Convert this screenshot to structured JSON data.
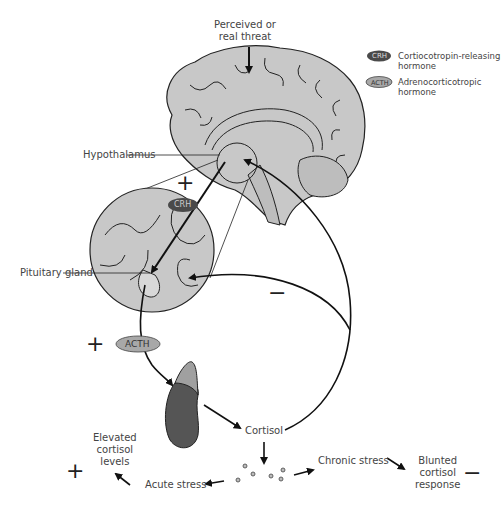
{
  "trigger": {
    "line1": "Perceived or",
    "line2": "real threat"
  },
  "legend": {
    "crh": {
      "abbr": "CRH",
      "label1": "Cortiocotropin-releasing",
      "label2": "hormone",
      "color": "#4a4a4a"
    },
    "acth": {
      "abbr": "ACTH",
      "label1": "Adrenocorticotropic",
      "label2": "hormone",
      "color": "#a8a8a8"
    }
  },
  "structures": {
    "hypothalamus": "Hypothalamus",
    "pituitary": "Pituitary gland"
  },
  "hormones": {
    "crh": "CRH",
    "acth": "ACTH",
    "cortisol": "Cortisol"
  },
  "signs": {
    "plus_crh": "+",
    "plus_acth": "+",
    "minus_feedback": "−",
    "plus_elevated": "+",
    "minus_blunted": "−"
  },
  "outcomes": {
    "acute": "Acute stress",
    "chronic": "Chronic stress",
    "elevated": {
      "line1": "Elevated",
      "line2": "cortisol",
      "line3": "levels"
    },
    "blunted": {
      "line1": "Blunted",
      "line2": "cortisol",
      "line3": "response"
    }
  },
  "colors": {
    "brain_fill": "#c8c8c8",
    "adrenal_dark": "#555555",
    "adrenal_cap": "#a0a0a0",
    "outline": "#222222"
  }
}
